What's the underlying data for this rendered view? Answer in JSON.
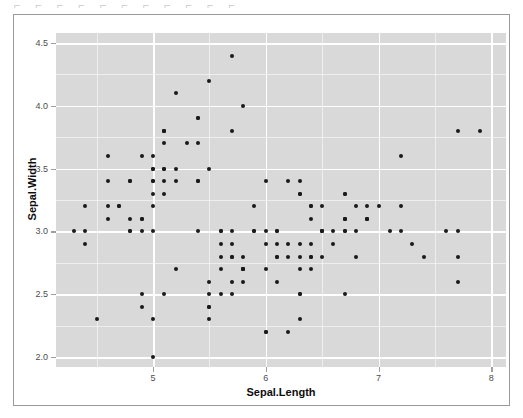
{
  "top_clip_text": "⌐  ⌐    ⌐    ⌐   ⌐    ⌐     ⌐     ⌐     ⌐    ⌐ ⌐",
  "chart_data": {
    "type": "scatter",
    "title": "",
    "xlabel": "Sepal.Length",
    "ylabel": "Sepal.Width",
    "xlim": [
      4.14,
      8.13
    ],
    "ylim": [
      1.92,
      4.58
    ],
    "xticks": [
      5,
      6,
      7,
      8
    ],
    "xticklabels": [
      "5",
      "6",
      "7",
      "8"
    ],
    "yticks": [
      2.0,
      2.5,
      3.0,
      3.5,
      4.0,
      4.5
    ],
    "yticklabels": [
      "2.0",
      "2.5",
      "3.0",
      "3.5",
      "4.0",
      "4.5"
    ],
    "x_minor_ticks": [
      4.5,
      5.5,
      6.5,
      7.5
    ],
    "y_minor_ticks": [
      2.25,
      2.75,
      3.25,
      3.75,
      4.25
    ],
    "grid": true,
    "legend": "none",
    "panel_background": "#d9d9d9",
    "grid_color": "#ffffff",
    "point_color": "#1a1a1a",
    "point_size": 4,
    "series": [
      {
        "name": "iris",
        "x": [
          5.1,
          4.9,
          4.7,
          4.6,
          5.0,
          5.4,
          4.6,
          5.0,
          4.4,
          4.9,
          5.4,
          4.8,
          4.8,
          4.3,
          5.8,
          5.7,
          5.4,
          5.1,
          5.7,
          5.1,
          5.4,
          5.1,
          4.6,
          5.1,
          4.8,
          5.0,
          5.0,
          5.2,
          5.2,
          4.7,
          4.8,
          5.4,
          5.2,
          5.5,
          4.9,
          5.0,
          5.5,
          4.9,
          4.4,
          5.1,
          5.0,
          4.5,
          4.4,
          5.0,
          5.1,
          4.8,
          5.1,
          4.6,
          5.3,
          5.0,
          7.0,
          6.4,
          6.9,
          5.5,
          6.5,
          5.7,
          6.3,
          4.9,
          6.6,
          5.2,
          5.0,
          5.9,
          6.0,
          6.1,
          5.6,
          6.7,
          5.6,
          5.8,
          6.2,
          5.6,
          5.9,
          6.1,
          6.3,
          6.1,
          6.4,
          6.6,
          6.8,
          6.7,
          6.0,
          5.7,
          5.5,
          5.5,
          5.8,
          6.0,
          5.4,
          6.0,
          6.7,
          6.3,
          5.6,
          5.5,
          5.5,
          6.1,
          5.8,
          5.0,
          5.6,
          5.7,
          5.7,
          6.2,
          5.1,
          5.7,
          6.3,
          5.8,
          7.1,
          6.3,
          6.5,
          7.6,
          4.9,
          7.3,
          6.7,
          7.2,
          6.5,
          6.4,
          6.8,
          5.7,
          5.8,
          6.4,
          6.5,
          7.7,
          7.7,
          6.0,
          6.9,
          5.6,
          7.7,
          6.3,
          6.7,
          7.2,
          6.2,
          6.1,
          6.4,
          7.2,
          7.4,
          7.9,
          6.4,
          6.3,
          6.1,
          7.7,
          6.3,
          6.4,
          6.0,
          6.9,
          6.7,
          6.9,
          5.8,
          6.8,
          6.7,
          6.7,
          6.3,
          6.5,
          6.2,
          5.9
        ],
        "y": [
          3.5,
          3.0,
          3.2,
          3.1,
          3.6,
          3.9,
          3.4,
          3.4,
          2.9,
          3.1,
          3.7,
          3.4,
          3.0,
          3.0,
          4.0,
          4.4,
          3.9,
          3.5,
          3.8,
          3.8,
          3.4,
          3.7,
          3.6,
          3.3,
          3.4,
          3.0,
          3.4,
          3.5,
          3.4,
          3.2,
          3.1,
          3.4,
          4.1,
          4.2,
          3.1,
          3.2,
          3.5,
          3.6,
          3.0,
          3.4,
          3.5,
          2.3,
          3.2,
          3.5,
          3.8,
          3.0,
          3.8,
          3.2,
          3.7,
          3.3,
          3.2,
          3.2,
          3.1,
          2.3,
          2.8,
          2.8,
          3.3,
          2.4,
          2.9,
          2.7,
          2.0,
          3.0,
          2.2,
          2.9,
          2.9,
          3.1,
          3.0,
          2.7,
          2.2,
          2.5,
          3.2,
          2.8,
          2.5,
          2.8,
          2.9,
          3.0,
          2.8,
          3.0,
          2.9,
          2.6,
          2.4,
          2.4,
          2.7,
          2.7,
          3.0,
          3.4,
          3.1,
          2.3,
          3.0,
          2.5,
          2.6,
          3.0,
          2.6,
          2.3,
          2.7,
          3.0,
          2.9,
          2.9,
          2.5,
          2.8,
          3.3,
          2.7,
          3.0,
          2.9,
          3.0,
          3.0,
          2.5,
          2.9,
          2.5,
          3.6,
          3.2,
          2.7,
          3.0,
          2.5,
          2.8,
          3.2,
          3.0,
          3.8,
          2.6,
          2.2,
          3.2,
          2.8,
          2.8,
          2.7,
          3.3,
          3.2,
          2.8,
          3.0,
          2.8,
          3.0,
          2.8,
          3.8,
          2.8,
          2.8,
          2.6,
          3.0,
          3.4,
          3.1,
          3.0,
          3.1,
          3.1,
          3.1,
          2.7,
          3.2,
          3.3,
          3.0,
          2.5,
          3.0,
          3.4,
          3.0
        ]
      }
    ]
  }
}
